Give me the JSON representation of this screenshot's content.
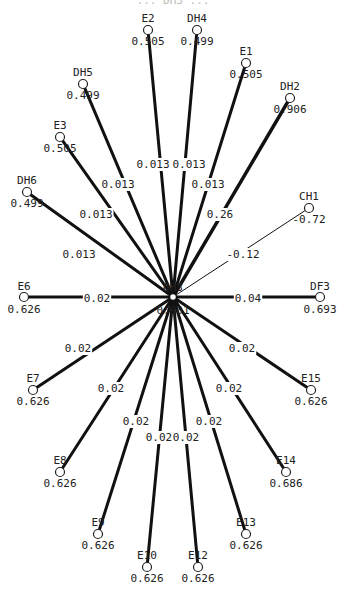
{
  "diagram": {
    "title": "... DH3 ...",
    "center": {
      "id": "DH3",
      "value": "0.901",
      "x": 173,
      "y": 297
    },
    "nodes": [
      {
        "id": "E2",
        "value": "0.505",
        "x": 148,
        "y": 30,
        "edge_label": "0.013",
        "lx": 153,
        "ly": 168,
        "weight": 3
      },
      {
        "id": "DH4",
        "value": "0.499",
        "x": 197,
        "y": 30,
        "edge_label": "0.013",
        "lx": 189,
        "ly": 168,
        "weight": 3
      },
      {
        "id": "DH5",
        "value": "0.499",
        "x": 83,
        "y": 84,
        "edge_label": "0.013",
        "lx": 118,
        "ly": 188,
        "weight": 3
      },
      {
        "id": "E1",
        "value": "0.505",
        "x": 246,
        "y": 63,
        "edge_label": "0.013",
        "lx": 208,
        "ly": 188,
        "weight": 3
      },
      {
        "id": "E3",
        "value": "0.505",
        "x": 60,
        "y": 137,
        "edge_label": "0.013",
        "lx": 96,
        "ly": 218,
        "weight": 3
      },
      {
        "id": "DH2",
        "value": "0.906",
        "x": 290,
        "y": 98,
        "edge_label": "0.26",
        "lx": 220,
        "ly": 218,
        "weight": 3.5
      },
      {
        "id": "DH6",
        "value": "0.499",
        "x": 27,
        "y": 192,
        "edge_label": "0.013",
        "lx": 79,
        "ly": 258,
        "weight": 3
      },
      {
        "id": "CH1",
        "value": "-0.72",
        "x": 309,
        "y": 208,
        "edge_label": "-0.12",
        "lx": 243,
        "ly": 258,
        "weight": 1
      },
      {
        "id": "E6",
        "value": "0.626",
        "x": 24,
        "y": 297,
        "edge_label": "0.02",
        "lx": 97,
        "ly": 302,
        "weight": 3
      },
      {
        "id": "DF3",
        "value": "0.693",
        "x": 320,
        "y": 297,
        "edge_label": "0.04",
        "lx": 248,
        "ly": 302,
        "weight": 3
      },
      {
        "id": "E7",
        "value": "0.626",
        "x": 33,
        "y": 390,
        "edge_label": "0.02",
        "lx": 78,
        "ly": 352,
        "weight": 3
      },
      {
        "id": "E15",
        "value": "0.626",
        "x": 311,
        "y": 390,
        "edge_label": "0.02",
        "lx": 242,
        "ly": 352,
        "weight": 3
      },
      {
        "id": "E8",
        "value": "0.626",
        "x": 60,
        "y": 472,
        "edge_label": "0.02",
        "lx": 111,
        "ly": 392,
        "weight": 3
      },
      {
        "id": "E14",
        "value": "0.686",
        "x": 286,
        "y": 472,
        "edge_label": "0.02",
        "lx": 229,
        "ly": 392,
        "weight": 3
      },
      {
        "id": "E9",
        "value": "0.626",
        "x": 98,
        "y": 534,
        "edge_label": "0.02",
        "lx": 136,
        "ly": 425,
        "weight": 3
      },
      {
        "id": "E13",
        "value": "0.626",
        "x": 246,
        "y": 534,
        "edge_label": "0.02",
        "lx": 209,
        "ly": 425,
        "weight": 3
      },
      {
        "id": "E10",
        "value": "0.626",
        "x": 147,
        "y": 567,
        "edge_label": "0.02",
        "lx": 159,
        "ly": 441,
        "weight": 3
      },
      {
        "id": "E12",
        "value": "0.626",
        "x": 198,
        "y": 567,
        "edge_label": "0.02",
        "lx": 186,
        "ly": 441,
        "weight": 3
      }
    ]
  }
}
